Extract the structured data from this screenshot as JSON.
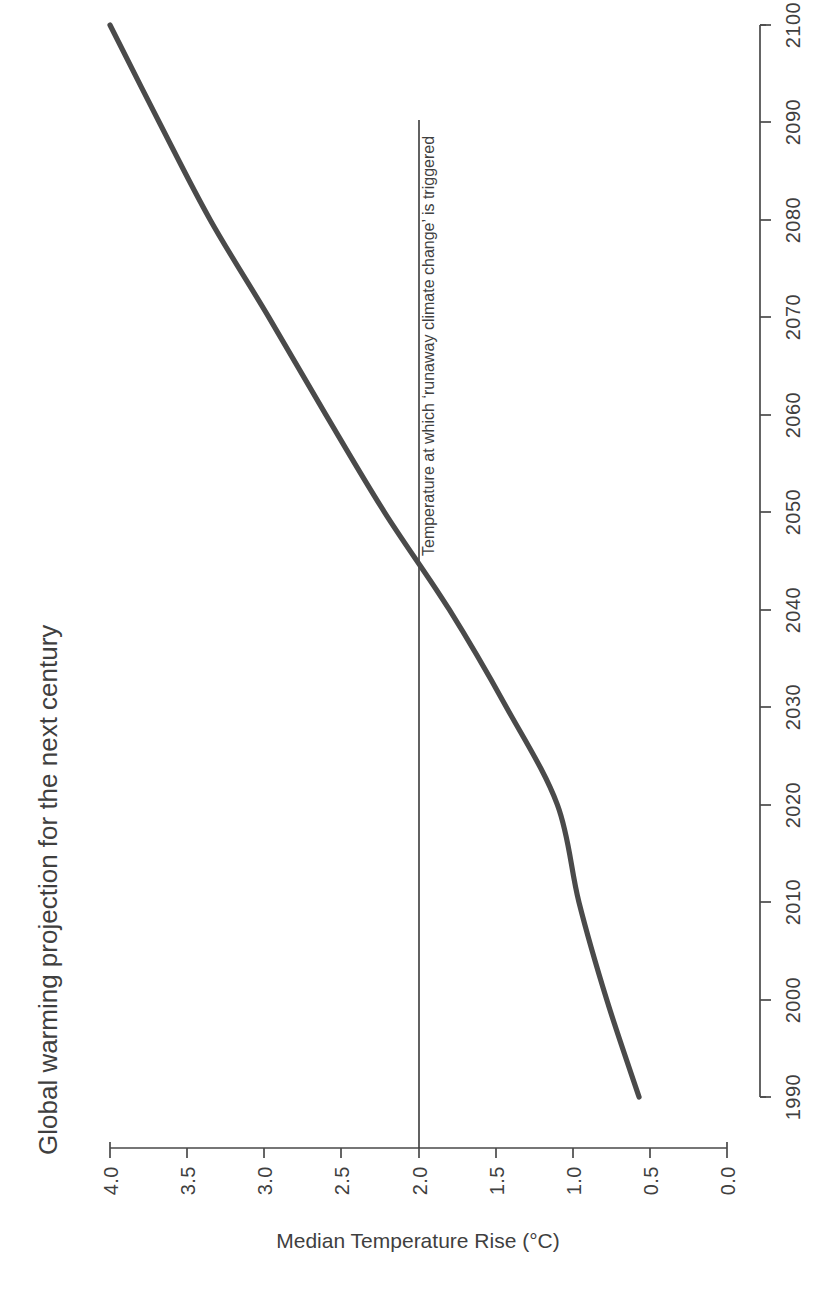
{
  "chart_data": {
    "type": "line",
    "title": "Global warming projection for the next century",
    "xlabel": "",
    "ylabel": "Median Temperature Rise (°C)",
    "orientation": "rotated-90-clockwise",
    "x": [
      1990,
      2000,
      2010,
      2020,
      2030,
      2040,
      2050,
      2060,
      2070,
      2080,
      2090,
      2100
    ],
    "values": [
      0.57,
      0.78,
      0.96,
      1.1,
      1.43,
      1.8,
      2.22,
      2.6,
      2.97,
      3.35,
      3.68,
      4.0
    ],
    "series": [
      {
        "name": "Median Temperature Rise",
        "values": [
          0.57,
          0.78,
          0.96,
          1.1,
          1.43,
          1.8,
          2.22,
          2.6,
          2.97,
          3.35,
          3.68,
          4.0
        ]
      }
    ],
    "x_tick_labels": [
      "1990",
      "2000",
      "2010",
      "2020",
      "2030",
      "2040",
      "2050",
      "2060",
      "2070",
      "2080",
      "2090",
      "2100"
    ],
    "y_tick_labels": [
      "0.0",
      "0.5",
      "1.0",
      "1.5",
      "2.0",
      "2.5",
      "3.0",
      "3.5",
      "4.0"
    ],
    "y_tick_values": [
      0.0,
      0.5,
      1.0,
      1.5,
      2.0,
      2.5,
      3.0,
      3.5,
      4.0
    ],
    "xlim": [
      1990,
      2100
    ],
    "ylim": [
      0.0,
      4.0
    ],
    "grid": false,
    "legend": false,
    "line_color": "#4a4a4a",
    "text_color": "#3f3f3f",
    "background": "#ffffff",
    "annotations": [
      {
        "text": "Temperature at which ‘runaway climate change’ is triggered",
        "value": 2.0,
        "kind": "threshold-line"
      }
    ]
  },
  "axis": {
    "value_axis_title": "Median Temperature Rise (°C)",
    "ticks_value": [
      "4.0",
      "3.5",
      "3.0",
      "2.5",
      "2.0",
      "1.5",
      "1.0",
      "0.5",
      "0.0"
    ],
    "ticks_year": [
      "2100",
      "2090",
      "2080",
      "2070",
      "2060",
      "2050",
      "2040",
      "2030",
      "2020",
      "2010",
      "2000",
      "1990"
    ]
  },
  "header": {
    "title": "Global warming projection for the next century"
  },
  "annotation": {
    "threshold_label": "Temperature at which ‘runaway climate change’ is triggered"
  }
}
